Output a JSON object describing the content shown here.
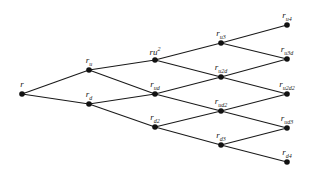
{
  "diagram": {
    "type": "binomial-tree",
    "colors": {
      "line": "#1a1a1a",
      "node": "#111111",
      "background": "#ffffff"
    },
    "nodes": [
      {
        "id": "n0",
        "x": 22,
        "y": 94,
        "base": "r",
        "sub": "",
        "sup": ""
      },
      {
        "id": "n1u",
        "x": 89,
        "y": 70,
        "base": "r",
        "sub": "u",
        "sup": ""
      },
      {
        "id": "n1d",
        "x": 89,
        "y": 104,
        "base": "r",
        "sub": "d",
        "sup": ""
      },
      {
        "id": "n2a",
        "x": 155,
        "y": 60,
        "base": "ru",
        "sub": "",
        "sup": "2"
      },
      {
        "id": "n2b",
        "x": 155,
        "y": 94,
        "base": "r",
        "sub": "ud",
        "sup": ""
      },
      {
        "id": "n2c",
        "x": 155,
        "y": 127,
        "base": "r",
        "sub": "d2",
        "sup": ""
      },
      {
        "id": "n3a",
        "x": 221,
        "y": 43,
        "base": "r",
        "sub": "u3",
        "sup": ""
      },
      {
        "id": "n3b",
        "x": 221,
        "y": 77,
        "base": "r",
        "sub": "u2d",
        "sup": ""
      },
      {
        "id": "n3c",
        "x": 221,
        "y": 111,
        "base": "r",
        "sub": "ud2",
        "sup": ""
      },
      {
        "id": "n3d",
        "x": 221,
        "y": 145,
        "base": "r",
        "sub": "d3",
        "sup": ""
      },
      {
        "id": "n4a",
        "x": 287,
        "y": 25,
        "base": "r",
        "sub": "u4",
        "sup": ""
      },
      {
        "id": "n4b",
        "x": 287,
        "y": 59,
        "base": "r",
        "sub": "u3d",
        "sup": ""
      },
      {
        "id": "n4c",
        "x": 287,
        "y": 94,
        "base": "r",
        "sub": "u2d2",
        "sup": ""
      },
      {
        "id": "n4d",
        "x": 287,
        "y": 128,
        "base": "r",
        "sub": "ud3",
        "sup": ""
      },
      {
        "id": "n4e",
        "x": 287,
        "y": 162,
        "base": "r",
        "sub": "d4",
        "sup": ""
      }
    ],
    "edges": [
      [
        "n0",
        "n1u"
      ],
      [
        "n0",
        "n1d"
      ],
      [
        "n1u",
        "n2a"
      ],
      [
        "n1u",
        "n2b"
      ],
      [
        "n1d",
        "n2b"
      ],
      [
        "n1d",
        "n2c"
      ],
      [
        "n2a",
        "n3a"
      ],
      [
        "n2a",
        "n3b"
      ],
      [
        "n2b",
        "n3b"
      ],
      [
        "n2b",
        "n3c"
      ],
      [
        "n2c",
        "n3c"
      ],
      [
        "n2c",
        "n3d"
      ],
      [
        "n3a",
        "n4a"
      ],
      [
        "n3a",
        "n4b"
      ],
      [
        "n3b",
        "n4b"
      ],
      [
        "n3b",
        "n4c"
      ],
      [
        "n3c",
        "n4c"
      ],
      [
        "n3c",
        "n4d"
      ],
      [
        "n3d",
        "n4d"
      ],
      [
        "n3d",
        "n4e"
      ]
    ]
  }
}
